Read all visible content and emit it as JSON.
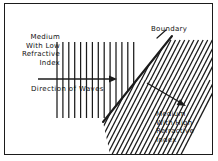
{
  "figure": {
    "background_color": "#ffffff",
    "line_color": "#1b1b1b",
    "text_color": "#111111",
    "width": 218,
    "height": 161
  },
  "labels": {
    "low_index_medium": {
      "lines": [
        "Medium",
        "With Low",
        "Refractive",
        "Index"
      ],
      "align": "right"
    },
    "high_index_medium": {
      "lines": [
        "Medium",
        "With High",
        "Refractive",
        "Index"
      ],
      "align": "left"
    },
    "direction_of_waves": "Direction of Waves",
    "boundary": "Boundary"
  },
  "geometry": {
    "frame": {
      "x": 4,
      "y": 3,
      "width": 209,
      "height": 152
    },
    "incident_wavefronts": {
      "count": 14,
      "x_start": 57,
      "x_spacing": 5.9,
      "y_top": 42,
      "y_bottom": 118,
      "orientation": "vertical"
    },
    "incident_arrow": {
      "x1": 38,
      "y1": 79,
      "x2": 117,
      "y2": 79
    },
    "boundary_line": {
      "x1": 103,
      "y1": 122,
      "x2": 172,
      "y2": 36
    },
    "boundary_leader": {
      "x1": 158,
      "y1": 37,
      "x2": 167,
      "y2": 30
    },
    "refracted_arrow": {
      "x1": 147,
      "y1": 83,
      "x2": 186,
      "y2": 106
    },
    "refracted_hatch": {
      "count": 21,
      "spacing": 4.1,
      "angle_deg": 63,
      "description": "compressed wavefronts in high refractive index medium"
    }
  }
}
